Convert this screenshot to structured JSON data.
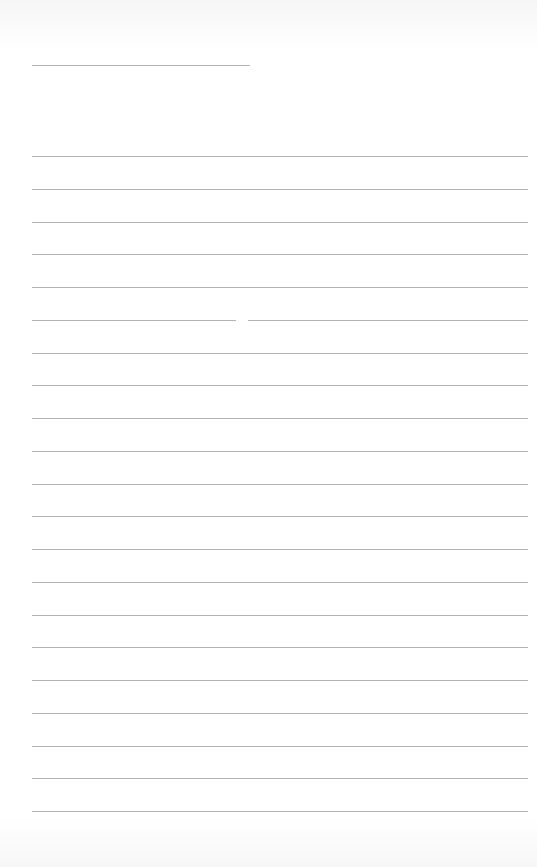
{
  "page": {
    "type": "blank-lined-sheet",
    "background": "#ffffff",
    "line_color": "#9a9a9a",
    "header_line": {
      "x1": 32,
      "x2": 250,
      "y": 65
    },
    "rule_lines": {
      "x1": 32,
      "x2": 528,
      "first_y": 156,
      "spacing": 32.75,
      "count": 21
    },
    "split_line": {
      "index": 5,
      "gap_x1": 236,
      "gap_x2": 248
    }
  }
}
